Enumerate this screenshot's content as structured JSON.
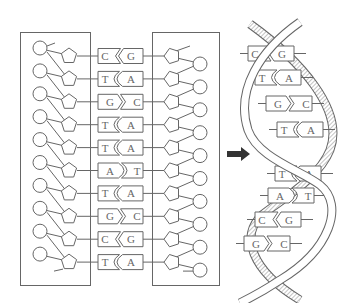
{
  "diagram": {
    "title": "",
    "colors": {
      "stroke": "#666666",
      "arrow": "#333333",
      "ribbon_fill": "#d9d9d9",
      "background": "#ffffff"
    },
    "ladder": {
      "left_strand_box": {
        "label": ""
      },
      "right_strand_box": {
        "label": ""
      },
      "base_pairs": [
        {
          "left": "C",
          "right": "G"
        },
        {
          "left": "T",
          "right": "A"
        },
        {
          "left": "G",
          "right": "C"
        },
        {
          "left": "T",
          "right": "A"
        },
        {
          "left": "T",
          "right": "A"
        },
        {
          "left": "A",
          "right": "T"
        },
        {
          "left": "T",
          "right": "A"
        },
        {
          "left": "G",
          "right": "C"
        },
        {
          "left": "C",
          "right": "G"
        },
        {
          "left": "T",
          "right": "A"
        }
      ],
      "left_units": {
        "phosphate": "circle",
        "sugar": "pentagon"
      },
      "right_units": {
        "phosphate": "circle",
        "sugar": "pentagon"
      }
    },
    "arrow": {
      "icon": "right-arrow-icon",
      "direction": "right"
    },
    "helix": {
      "base_pairs": [
        {
          "left": "C",
          "right": "G"
        },
        {
          "left": "T",
          "right": "A"
        },
        {
          "left": "G",
          "right": "C"
        },
        {
          "left": "T",
          "right": "A"
        },
        {
          "left": "T",
          "right": "A"
        },
        {
          "left": "A",
          "right": "T"
        },
        {
          "left": "C",
          "right": "G"
        },
        {
          "left": "G",
          "right": "C"
        }
      ]
    }
  }
}
